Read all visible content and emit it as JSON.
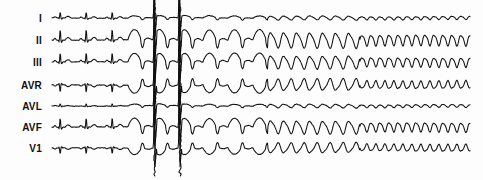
{
  "figure": {
    "kind": "ecg-rhythm-strip",
    "width": 483,
    "height": 180,
    "background_color": "#fdfdfd",
    "trace_color": "#111111",
    "label_color": "#101010"
  },
  "leads": [
    {
      "label": "I",
      "label_x": 42,
      "baseline_y": 18,
      "amp": 1.0
    },
    {
      "label": "II",
      "label_x": 42,
      "baseline_y": 40,
      "amp": 1.35
    },
    {
      "label": "III",
      "label_x": 42,
      "baseline_y": 62,
      "amp": 1.15
    },
    {
      "label": "AVR",
      "label_x": 42,
      "baseline_y": 85,
      "amp": -1.1
    },
    {
      "label": "AVL",
      "label_x": 42,
      "baseline_y": 106,
      "amp": 0.55
    },
    {
      "label": "AVF",
      "label_x": 42,
      "baseline_y": 127,
      "amp": 1.15
    },
    {
      "label": "V1",
      "label_x": 42,
      "baseline_y": 148,
      "amp": -0.95
    }
  ],
  "chart_data": {
    "type": "line",
    "title": "",
    "xlabel": "",
    "ylabel": "",
    "trace_start_x": 52,
    "trace_end_x": 470,
    "segments": [
      {
        "name": "sinus-rhythm",
        "x_start": 52,
        "x_end": 128,
        "rhythm": "normal sinus rhythm",
        "beat_period_px": 26,
        "beats": 3
      },
      {
        "name": "wide-complex-tachycardia",
        "x_start": 128,
        "x_end": 268,
        "rhythm": "ventricular tachycardia, wide bizarre QRS",
        "beat_period_px": 25,
        "beats": 6
      },
      {
        "name": "accelerating-vt",
        "x_start": 268,
        "x_end": 360,
        "rhythm": "accelerating ventricular tachycardia",
        "beat_period_px": 13,
        "beats": 7
      },
      {
        "name": "ventricular-flutter",
        "x_start": 360,
        "x_end": 470,
        "rhythm": "ventricular flutter / fibrillation, sinusoidal",
        "beat_period_px": 9,
        "beats": 12
      }
    ],
    "annotations": [
      {
        "name": "tall-spike-1",
        "x": 155,
        "description": "full-height vertical deflection spanning all leads"
      },
      {
        "name": "tall-spike-2",
        "x": 180,
        "description": "full-height vertical deflection spanning all leads"
      }
    ]
  }
}
